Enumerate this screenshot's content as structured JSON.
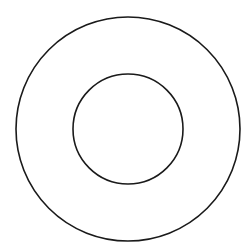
{
  "diagram": {
    "type": "concentric-circles",
    "background": "#ffffff",
    "stroke_color": "#1a1a1a",
    "stroke_width": 1.6,
    "center": {
      "x": 128,
      "y": 129
    },
    "circles": [
      {
        "name": "outer-circle",
        "radius": 112
      },
      {
        "name": "inner-circle",
        "radius": 55
      }
    ]
  }
}
